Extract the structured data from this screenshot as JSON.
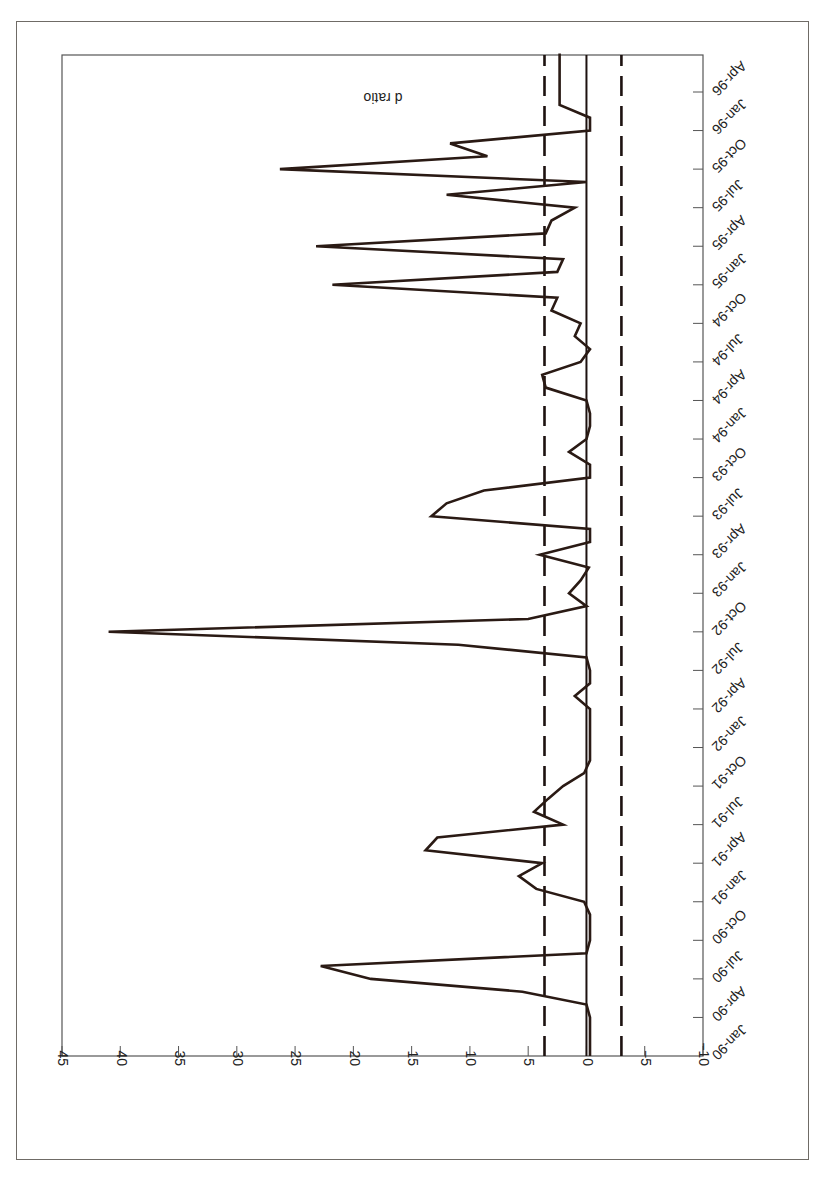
{
  "chart_data": {
    "type": "line",
    "orientation_note": "figure printed rotated 180 degrees",
    "title": "",
    "xlabel": "",
    "ylabel": "d ratio",
    "ylim": [
      -10,
      45
    ],
    "yticks": [
      45,
      40,
      35,
      30,
      25,
      20,
      15,
      10,
      5,
      0,
      -5,
      -10
    ],
    "ytick_labels": [
      "45",
      "40",
      "35",
      "30",
      "25",
      "20",
      "15",
      "10",
      "5",
      "0",
      "−5",
      "−10"
    ],
    "xtick_labels": [
      "Jan-90",
      "Apr-90",
      "Jul-90",
      "Oct-90",
      "Jan-91",
      "Apr-91",
      "Jul-91",
      "Oct-91",
      "Jan-92",
      "Apr-92",
      "Jul-92",
      "Oct-92",
      "Jan-93",
      "Apr-93",
      "Jul-93",
      "Oct-93",
      "Jan-94",
      "Apr-94",
      "Jul-94",
      "Oct-94",
      "Jan-95",
      "Apr-95",
      "Jul-95",
      "Oct-95",
      "Jan-96",
      "Apr-96"
    ],
    "grid": false,
    "legend": null,
    "reference_lines": [
      {
        "name": "zero",
        "value": 0,
        "style": "solid"
      },
      {
        "name": "upper-bound",
        "value": 3.6,
        "style": "dashed"
      },
      {
        "name": "lower-bound",
        "value": -3.0,
        "style": "dashed"
      }
    ],
    "series": [
      {
        "name": "d ratio",
        "x_months_from_jan90": [
          0,
          1,
          2,
          3,
          4,
          5,
          6,
          7,
          8,
          9,
          10,
          11,
          12,
          13,
          14,
          15,
          16,
          17,
          18,
          19,
          20,
          21,
          22,
          23,
          24,
          25,
          26,
          27,
          28,
          29,
          30,
          31,
          32,
          33,
          34,
          35,
          36,
          37,
          38,
          39,
          40,
          41,
          42,
          43,
          44,
          45,
          46,
          47,
          48,
          49,
          50,
          51,
          52,
          53,
          54,
          55,
          56,
          57,
          58,
          59,
          60,
          61,
          62,
          63,
          64,
          65,
          66,
          67,
          68,
          69,
          70,
          71,
          72,
          73,
          74,
          75,
          76,
          77,
          78
        ],
        "values": [
          -0.3,
          -0.3,
          -0.3,
          -0.3,
          0,
          5.5,
          18.5,
          22.8,
          0,
          -0.3,
          -0.3,
          -0.3,
          0.2,
          4.3,
          5.8,
          3.8,
          13.8,
          12.8,
          2,
          4.5,
          3.3,
          2,
          0.2,
          -0.3,
          -0.3,
          -0.3,
          -0.3,
          -0.3,
          1,
          -0.3,
          -0.3,
          0,
          11,
          41,
          5,
          0,
          1.5,
          0.5,
          -0.2,
          4,
          -0.3,
          -0.3,
          13.3,
          12,
          8.8,
          -0.3,
          -0.3,
          1.5,
          0,
          -0.3,
          -0.3,
          0,
          3.5,
          3.8,
          0.5,
          -0.3,
          1,
          0.5,
          3,
          2.5,
          21.8,
          2.5,
          2,
          23.2,
          3.5,
          3,
          1,
          12,
          0,
          26.3,
          8.5,
          11.7,
          -0.3,
          -0.3,
          2.3,
          2.3,
          2.3,
          2.3,
          2.3
        ]
      }
    ]
  },
  "axes": {
    "ylabel": "d ratio"
  }
}
